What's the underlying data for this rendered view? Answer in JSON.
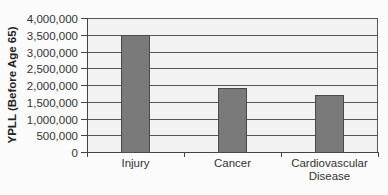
{
  "chart_data": {
    "type": "bar",
    "title": "",
    "xlabel": "",
    "ylabel": "YPLL (Before Age 65)",
    "categories": [
      "Injury",
      "Cancer",
      "Cardiovascular Disease"
    ],
    "category_lines": [
      [
        "Injury"
      ],
      [
        "Cancer"
      ],
      [
        "Cardiovascular",
        "Disease"
      ]
    ],
    "values": [
      3500000,
      1900000,
      1700000
    ],
    "ylim": [
      0,
      4000000
    ],
    "yticks": [
      0,
      500000,
      1000000,
      1500000,
      2000000,
      2500000,
      3000000,
      3500000,
      4000000
    ],
    "ytick_labels": [
      "0",
      "500,000",
      "1,000,000",
      "1,500,000",
      "2,000,000",
      "2,500,000",
      "3,000,000",
      "3,500,000",
      "4,000,000"
    ],
    "grid": true,
    "legend": null,
    "colors": {
      "bar": "#7a7a7a",
      "bar_border": "#4a4a4a",
      "plot_bg": "#f2f2f2",
      "gridline": "#555555"
    }
  }
}
